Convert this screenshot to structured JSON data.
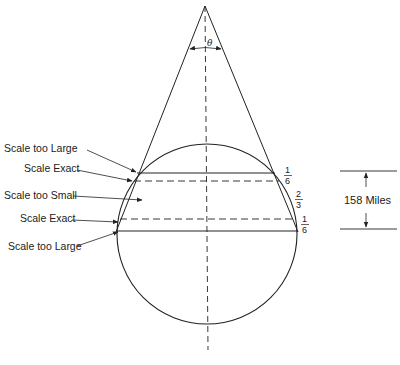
{
  "diagram": {
    "type": "secant-cone-projection",
    "angle_label": "θ",
    "labels": [
      {
        "id": "top-large",
        "text": "Scale too Large"
      },
      {
        "id": "top-exact",
        "text": "Scale Exact"
      },
      {
        "id": "middle-small",
        "text": "Scale too Small"
      },
      {
        "id": "bottom-exact",
        "text": "Scale Exact"
      },
      {
        "id": "bottom-large",
        "text": "Scale too Large"
      }
    ],
    "fractions": [
      {
        "id": "upper",
        "numerator": "1",
        "denominator": "6"
      },
      {
        "id": "middle",
        "numerator": "2",
        "denominator": "3"
      },
      {
        "id": "lower",
        "numerator": "1",
        "denominator": "6"
      }
    ],
    "dimension": {
      "text": "158 Miles"
    },
    "colors": {
      "line": "#222222",
      "background": "#ffffff"
    }
  }
}
